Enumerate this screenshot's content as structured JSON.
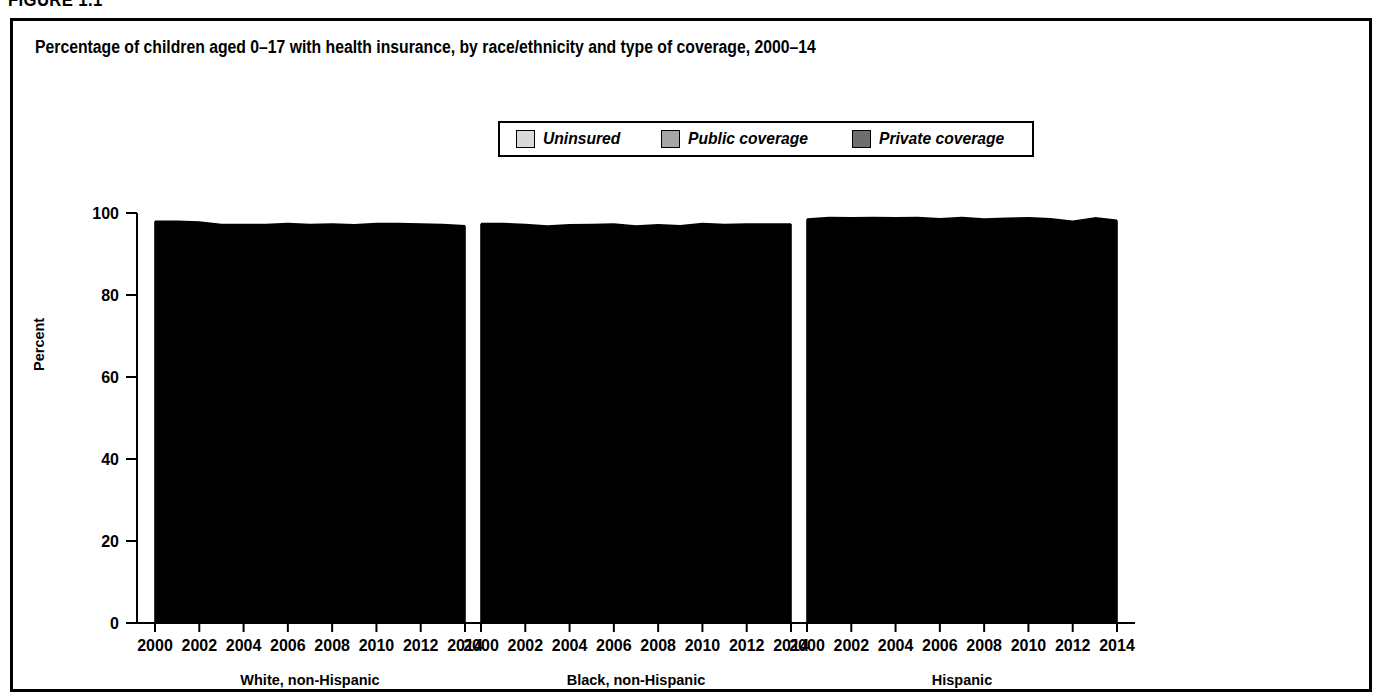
{
  "figure_number": "FIGURE 1.1",
  "chart_title": "Percentage of children aged 0–17 with health insurance, by race/ethnicity and type of coverage, 2000–14",
  "axis": {
    "ylabel": "Percent",
    "yticks": [
      "0",
      "20",
      "40",
      "60",
      "80",
      "100"
    ],
    "xticks": [
      "2000",
      "2002",
      "2004",
      "2006",
      "2008",
      "2010",
      "2012",
      "2014"
    ]
  },
  "legend": {
    "items": [
      {
        "label": "Uninsured",
        "color": "#d9d9d9"
      },
      {
        "label": "Public coverage",
        "color": "#a6a6a6"
      },
      {
        "label": "Private coverage",
        "color": "#6e6e6e"
      }
    ]
  },
  "chart_data": {
    "type": "area",
    "title": "Percentage of children aged 0–17 with health insurance, by race/ethnicity and type of coverage, 2000–14",
    "xlabel": "",
    "ylabel": "Percent",
    "ylim": [
      0,
      100
    ],
    "xlim": [
      2000,
      2014
    ],
    "grid": false,
    "legend_position": "top-center",
    "stacked": true,
    "x": [
      2000,
      2001,
      2002,
      2003,
      2004,
      2005,
      2006,
      2007,
      2008,
      2009,
      2010,
      2011,
      2012,
      2013,
      2014
    ],
    "panels": [
      {
        "name": "White, non-Hispanic",
        "series": [
          {
            "name": "Uninsured",
            "values": [
              9.0,
              8.0,
              7.6,
              7.0,
              6.8,
              6.6,
              7.0,
              6.7,
              6.6,
              6.2,
              5.8,
              5.2,
              5.3,
              5.1,
              4.9
            ]
          },
          {
            "name": "Public coverage",
            "values": [
              11.6,
              13.0,
              15.0,
              15.2,
              15.6,
              16.3,
              17.5,
              17.0,
              19.0,
              21.0,
              22.7,
              24.5,
              24.3,
              24.5,
              24.7
            ]
          },
          {
            "name": "Private coverage",
            "values": [
              77.4,
              77.0,
              75.2,
              75.0,
              74.8,
              74.3,
              72.9,
              73.5,
              71.7,
              69.9,
              68.9,
              67.7,
              67.7,
              67.6,
              67.3
            ]
          }
        ],
        "cumulative_uninsured": [
          9.0,
          8.0,
          7.6,
          7.0,
          6.8,
          6.6,
          7.0,
          6.7,
          6.6,
          6.2,
          5.8,
          5.2,
          5.3,
          5.1,
          4.9
        ],
        "cumulative_public": [
          20.6,
          21.0,
          22.6,
          22.2,
          22.4,
          22.9,
          24.5,
          23.7,
          25.6,
          27.2,
          28.5,
          29.7,
          29.6,
          29.6,
          29.6
        ],
        "total_covered": [
          98.0,
          98.0,
          97.8,
          97.2,
          97.2,
          97.2,
          97.4,
          97.2,
          97.3,
          97.1,
          97.4,
          97.4,
          97.3,
          97.2,
          96.9
        ]
      },
      {
        "name": "Black, non-Hispanic",
        "series": [
          {
            "name": "Uninsured",
            "values": [
              13.0,
              11.4,
              10.2,
              8.9,
              7.9,
              8.7,
              8.6,
              7.6,
              8.3,
              8.0,
              6.8,
              6.3,
              5.3,
              5.2,
              4.6
            ]
          },
          {
            "name": "Public coverage",
            "values": [
              37.0,
              39.6,
              42.4,
              42.6,
              44.1,
              44.0,
              46.2,
              48.2,
              49.4,
              52.6,
              54.4,
              56.7,
              58.5,
              58.9,
              59.1
            ]
          },
          {
            "name": "Private coverage",
            "values": [
              47.4,
              46.4,
              44.6,
              45.3,
              45.1,
              44.5,
              42.5,
              41.0,
              39.4,
              36.3,
              36.2,
              34.2,
              33.5,
              33.2,
              33.6
            ]
          }
        ],
        "cumulative_uninsured": [
          13.0,
          11.4,
          10.2,
          8.9,
          7.9,
          8.7,
          8.6,
          7.6,
          8.3,
          8.0,
          6.8,
          6.3,
          5.3,
          5.2,
          4.6
        ],
        "cumulative_public": [
          50.0,
          51.0,
          52.6,
          51.5,
          52.0,
          52.7,
          54.8,
          55.8,
          57.7,
          60.6,
          61.2,
          63.0,
          63.8,
          64.1,
          63.7
        ],
        "total_covered": [
          97.4,
          97.4,
          97.2,
          96.8,
          97.1,
          97.2,
          97.3,
          96.8,
          97.1,
          96.9,
          97.4,
          97.2,
          97.3,
          97.3,
          97.3
        ]
      },
      {
        "name": "Hispanic",
        "series": [
          {
            "name": "Uninsured",
            "values": [
              27.0,
              25.0,
              23.0,
              21.4,
              21.0,
              22.0,
              19.0,
              19.8,
              18.0,
              16.4,
              15.3,
              13.6,
              12.2,
              12.6,
              11.1
            ]
          },
          {
            "name": "Public coverage",
            "values": [
              28.0,
              32.0,
              36.2,
              38.4,
              40.0,
              39.6,
              44.3,
              44.2,
              47.3,
              49.8,
              51.8,
              54.6,
              56.4,
              58.4,
              56.6
            ]
          },
          {
            "name": "Private coverage",
            "values": [
              43.5,
              41.9,
              39.6,
              39.1,
              37.8,
              37.3,
              35.3,
              34.9,
              33.2,
              32.5,
              31.7,
              30.4,
              29.4,
              27.8,
              30.5
            ]
          }
        ],
        "cumulative_uninsured": [
          27.0,
          25.0,
          23.0,
          21.4,
          21.0,
          22.0,
          19.0,
          19.8,
          18.0,
          16.4,
          15.3,
          13.6,
          12.2,
          12.6,
          11.1
        ],
        "cumulative_public": [
          55.0,
          57.0,
          59.2,
          59.8,
          61.0,
          61.6,
          63.3,
          64.0,
          65.3,
          66.2,
          67.1,
          68.2,
          68.6,
          71.0,
          67.7
        ],
        "total_covered": [
          98.5,
          98.9,
          98.8,
          98.9,
          98.8,
          98.9,
          98.6,
          98.9,
          98.5,
          98.7,
          98.8,
          98.6,
          98.0,
          98.8,
          98.2
        ]
      }
    ]
  }
}
